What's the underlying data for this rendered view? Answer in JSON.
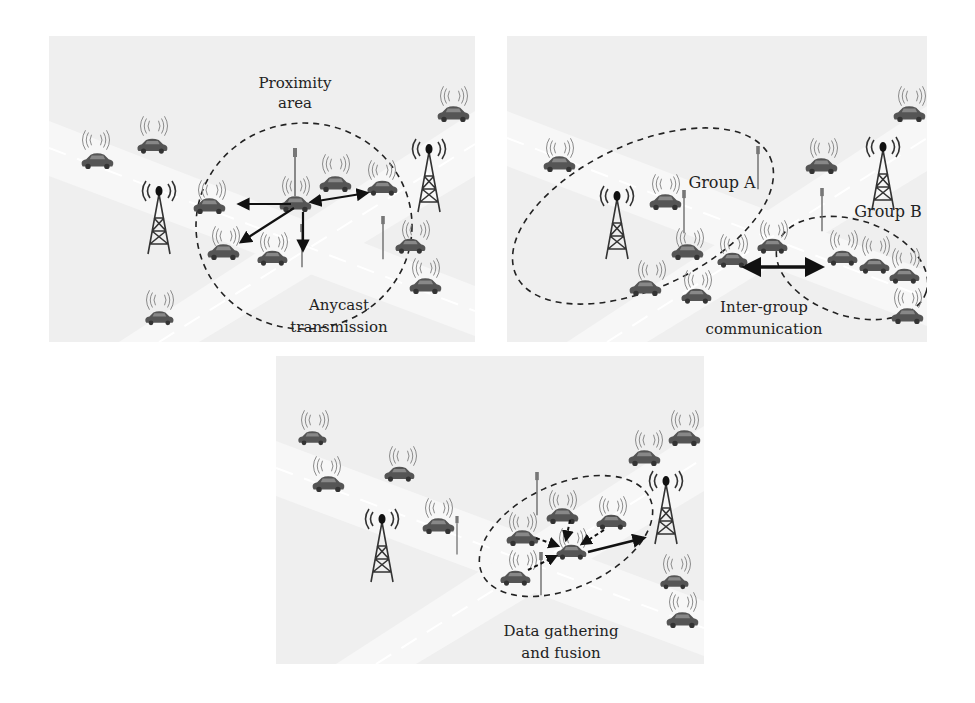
{
  "figure": {
    "panels": [
      {
        "id": "anycast",
        "labels": {
          "area_line1": "Proximity",
          "area_line2": "area",
          "caption_line1": "Anycast",
          "caption_line2": "transmission"
        }
      },
      {
        "id": "inter-group",
        "labels": {
          "group_a": "Group A",
          "group_b": "Group B",
          "caption_line1": "Inter-group",
          "caption_line2": "communication"
        }
      },
      {
        "id": "data-gathering",
        "labels": {
          "caption_line1": "Data gathering",
          "caption_line2": "and fusion"
        }
      }
    ],
    "colors": {
      "background": "#efefef",
      "road": "#f7f7f7",
      "car": "#555555",
      "ink": "#222222"
    }
  }
}
